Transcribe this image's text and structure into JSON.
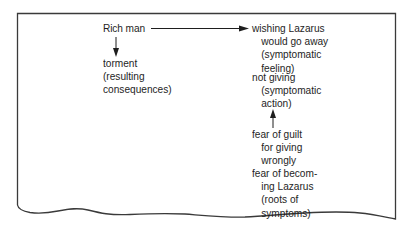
{
  "diagram": {
    "source_node": {
      "label": "Rich man"
    },
    "consequence_node": {
      "lines": [
        "torment",
        "(resulting",
        "consequences)"
      ]
    },
    "symptom_feeling_node": {
      "lines": [
        "wishing Lazarus",
        "would go away",
        "(symptomatic",
        "feeling)"
      ],
      "indented_from": 1
    },
    "symptom_action_node": {
      "lines": [
        "not giving",
        "(symptomatic",
        "action)"
      ],
      "indented_from": 1
    },
    "root_guilt_node": {
      "lines": [
        "fear of guilt",
        "for giving",
        "wrongly"
      ],
      "indented_from": 1
    },
    "root_becoming_node": {
      "lines": [
        "fear of becom-",
        "ing Lazarus",
        "(roots of",
        "symptoms)"
      ],
      "indented_from": 1
    },
    "arrows": [
      {
        "from": "Rich man",
        "to": "wishing Lazarus would go away",
        "direction": "right"
      },
      {
        "from": "Rich man",
        "to": "torment",
        "direction": "down"
      },
      {
        "from": "fear of guilt",
        "to": "not giving",
        "direction": "up"
      }
    ],
    "colors": {
      "ink": "#1e1e1e",
      "paper": "#ffffff",
      "frame": "#3a3a3a"
    }
  }
}
